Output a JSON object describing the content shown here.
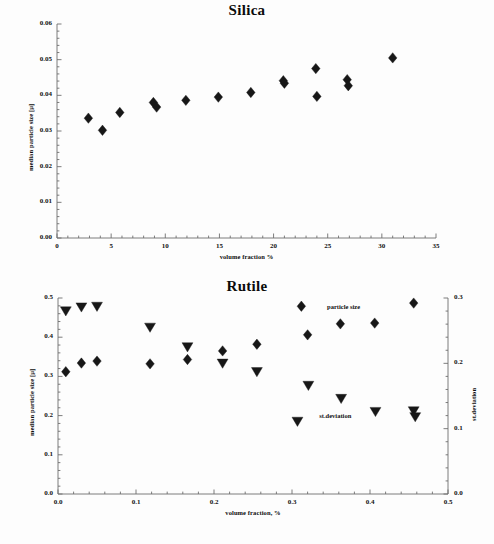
{
  "document": {
    "kind": "scientific-figure-pair",
    "background_color": "#fdfdfd",
    "marker_color": "#171717"
  },
  "chart_data": [
    {
      "id": "silica",
      "type": "scatter",
      "title": "Silica",
      "xlabel": "volume fraction %",
      "ylabel": "median particle size [µ]",
      "xlim": [
        0,
        35
      ],
      "ylim": [
        0.0,
        0.06
      ],
      "xticks": [
        0,
        5,
        10,
        15,
        20,
        25,
        30,
        35
      ],
      "xticklabels": [
        "0",
        "5",
        "10",
        "15",
        "20",
        "25",
        "30",
        "35"
      ],
      "yticks": [
        0.0,
        0.01,
        0.02,
        0.03,
        0.04,
        0.05,
        0.06
      ],
      "yticklabels": [
        "0.00",
        "0.01",
        "0.02",
        "0.03",
        "0.04",
        "0.05",
        "0.06"
      ],
      "minor_ticks": true,
      "grid": false,
      "legend": "none",
      "series": [
        {
          "name": "median particle size",
          "marker": "diamond",
          "color": "#171717",
          "points": [
            {
              "x": 2.9,
              "y": 0.0336
            },
            {
              "x": 4.2,
              "y": 0.0302
            },
            {
              "x": 5.8,
              "y": 0.0352
            },
            {
              "x": 8.9,
              "y": 0.038
            },
            {
              "x": 9.2,
              "y": 0.0367
            },
            {
              "x": 11.9,
              "y": 0.0386
            },
            {
              "x": 14.9,
              "y": 0.0395
            },
            {
              "x": 17.9,
              "y": 0.0408
            },
            {
              "x": 20.9,
              "y": 0.0441
            },
            {
              "x": 21.0,
              "y": 0.0434
            },
            {
              "x": 23.9,
              "y": 0.0475
            },
            {
              "x": 24.0,
              "y": 0.0397
            },
            {
              "x": 26.8,
              "y": 0.0444
            },
            {
              "x": 26.9,
              "y": 0.0427
            },
            {
              "x": 31.0,
              "y": 0.0505
            }
          ]
        }
      ]
    },
    {
      "id": "rutile",
      "type": "scatter",
      "title": "Rutile",
      "xlabel": "volume fraction, %",
      "ylabel": "median particle size [µ]",
      "y2label": "st.deviation",
      "xlim": [
        0.0,
        0.5
      ],
      "ylim": [
        0.0,
        0.5
      ],
      "y2lim": [
        0.0,
        0.3
      ],
      "xticks": [
        0.0,
        0.1,
        0.2,
        0.3,
        0.4,
        0.5
      ],
      "xticklabels": [
        "0.0",
        "0.1",
        "0.2",
        "0.3",
        "0.4",
        "0.5"
      ],
      "yticks": [
        0.0,
        0.1,
        0.2,
        0.3,
        0.4,
        0.5
      ],
      "yticklabels": [
        "0.0",
        "0.1",
        "0.2",
        "0.3",
        "0.4",
        "0.5"
      ],
      "y2ticks": [
        0.0,
        0.1,
        0.2,
        0.3
      ],
      "y2ticklabels": [
        "0.0",
        "0.1",
        "0.2",
        "0.3"
      ],
      "minor_ticks": true,
      "grid": false,
      "annotations": [
        {
          "text": "particle size",
          "x": 0.345,
          "y": 0.477,
          "axis": "left"
        },
        {
          "text": "st.deviation",
          "x": 0.335,
          "y": 0.198,
          "axis": "left"
        }
      ],
      "series": [
        {
          "name": "particle size",
          "marker": "diamond",
          "color": "#171717",
          "axis": "left",
          "points": [
            {
              "x": 0.01,
              "y": 0.312
            },
            {
              "x": 0.03,
              "y": 0.334
            },
            {
              "x": 0.05,
              "y": 0.339
            },
            {
              "x": 0.118,
              "y": 0.332
            },
            {
              "x": 0.166,
              "y": 0.343
            },
            {
              "x": 0.211,
              "y": 0.365
            },
            {
              "x": 0.255,
              "y": 0.382
            },
            {
              "x": 0.312,
              "y": 0.479
            },
            {
              "x": 0.32,
              "y": 0.406
            },
            {
              "x": 0.362,
              "y": 0.434
            },
            {
              "x": 0.406,
              "y": 0.436
            },
            {
              "x": 0.456,
              "y": 0.487
            }
          ]
        },
        {
          "name": "st.deviation",
          "marker": "triangle-down",
          "color": "#171717",
          "axis": "right",
          "points": [
            {
              "x": 0.01,
              "y": 0.28
            },
            {
              "x": 0.03,
              "y": 0.286
            },
            {
              "x": 0.05,
              "y": 0.287
            },
            {
              "x": 0.118,
              "y": 0.255
            },
            {
              "x": 0.166,
              "y": 0.225
            },
            {
              "x": 0.211,
              "y": 0.2
            },
            {
              "x": 0.255,
              "y": 0.187
            },
            {
              "x": 0.307,
              "y": 0.111
            },
            {
              "x": 0.321,
              "y": 0.166
            },
            {
              "x": 0.363,
              "y": 0.146
            },
            {
              "x": 0.407,
              "y": 0.126
            },
            {
              "x": 0.456,
              "y": 0.127
            },
            {
              "x": 0.458,
              "y": 0.118
            }
          ]
        }
      ]
    }
  ],
  "silica": {
    "title": "Silica",
    "xlabel": "volume fraction %",
    "ylabel": "median particle size [µ]"
  },
  "rutile": {
    "title": "Rutile",
    "xlabel": "volume fraction, %",
    "ylabel": "median particle size [µ]",
    "y2label": "st.deviation",
    "annot_particle": "particle size",
    "annot_stdev": "st.deviation"
  }
}
